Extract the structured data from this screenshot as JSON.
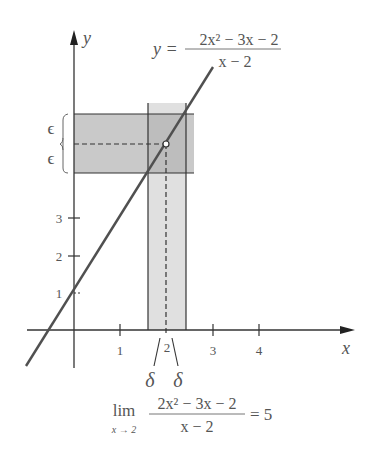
{
  "figure": {
    "function_label": {
      "prefix": "y =",
      "numerator": "2x² − 3x − 2",
      "denominator": "x − 2"
    },
    "axes": {
      "x_label": "x",
      "y_label": "y",
      "x_ticks": [
        "1",
        "2",
        "3",
        "4"
      ],
      "y_ticks": [
        "1",
        "2",
        "3"
      ]
    },
    "epsilon_labels": [
      "ϵ",
      "ϵ"
    ],
    "delta_labels": [
      "δ",
      "δ"
    ],
    "limit_expression": {
      "lim": "lim",
      "subscript": "x → 2",
      "numerator": "2x² − 3x − 2",
      "denominator": "x − 2",
      "result": "= 5"
    },
    "colors": {
      "epsilon_band": "#c8c8c8",
      "delta_band": "#dedede",
      "line": "#505050",
      "axes": "#333333"
    }
  }
}
